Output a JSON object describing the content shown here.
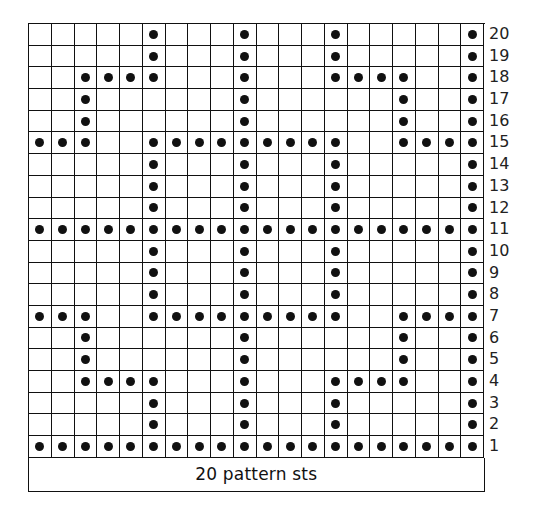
{
  "chart": {
    "title": "",
    "footer_label": "20 pattern sts",
    "columns": 20,
    "rows": 20,
    "symbol_legend": {
      "dot": "purl (filled dot)",
      "empty": "knit (empty square)"
    },
    "colors": {
      "grid_line": "#111111",
      "dot": "#111111",
      "background": "#ffffff"
    },
    "row_labels": [
      "20",
      "19",
      "18",
      "17",
      "16",
      "15",
      "14",
      "13",
      "12",
      "11",
      "10",
      "9",
      "8",
      "7",
      "6",
      "5",
      "4",
      "3",
      "2",
      "1"
    ]
  },
  "chart_data": {
    "type": "heatmap",
    "xlabel": "20 pattern sts",
    "ylabel": "Rows",
    "grid": true,
    "row_order": "top-to-bottom (row 20 first)",
    "rows": [
      {
        "row": 20,
        "dots": [
          6,
          10,
          14,
          20
        ]
      },
      {
        "row": 19,
        "dots": [
          6,
          10,
          14,
          20
        ]
      },
      {
        "row": 18,
        "dots": [
          3,
          4,
          5,
          6,
          10,
          14,
          15,
          16,
          17,
          20
        ]
      },
      {
        "row": 17,
        "dots": [
          3,
          10,
          17,
          20
        ]
      },
      {
        "row": 16,
        "dots": [
          3,
          10,
          17,
          20
        ]
      },
      {
        "row": 15,
        "dots": [
          1,
          2,
          3,
          6,
          7,
          8,
          9,
          10,
          11,
          12,
          13,
          14,
          17,
          18,
          19,
          20
        ]
      },
      {
        "row": 14,
        "dots": [
          6,
          10,
          14,
          20
        ]
      },
      {
        "row": 13,
        "dots": [
          6,
          10,
          14,
          20
        ]
      },
      {
        "row": 12,
        "dots": [
          6,
          10,
          14,
          20
        ]
      },
      {
        "row": 11,
        "dots": [
          1,
          2,
          3,
          4,
          5,
          6,
          7,
          8,
          9,
          10,
          11,
          12,
          13,
          14,
          15,
          16,
          17,
          18,
          19,
          20
        ]
      },
      {
        "row": 10,
        "dots": [
          6,
          10,
          14,
          20
        ]
      },
      {
        "row": 9,
        "dots": [
          6,
          10,
          14,
          20
        ]
      },
      {
        "row": 8,
        "dots": [
          6,
          10,
          14,
          20
        ]
      },
      {
        "row": 7,
        "dots": [
          1,
          2,
          3,
          6,
          7,
          8,
          9,
          10,
          11,
          12,
          13,
          14,
          17,
          18,
          19,
          20
        ]
      },
      {
        "row": 6,
        "dots": [
          3,
          10,
          17,
          20
        ]
      },
      {
        "row": 5,
        "dots": [
          3,
          10,
          17,
          20
        ]
      },
      {
        "row": 4,
        "dots": [
          3,
          4,
          5,
          6,
          10,
          14,
          15,
          16,
          17,
          20
        ]
      },
      {
        "row": 3,
        "dots": [
          6,
          10,
          14,
          20
        ]
      },
      {
        "row": 2,
        "dots": [
          6,
          10,
          14,
          20
        ]
      },
      {
        "row": 1,
        "dots": [
          1,
          2,
          3,
          4,
          5,
          6,
          7,
          8,
          9,
          10,
          11,
          12,
          13,
          14,
          15,
          16,
          17,
          18,
          19,
          20
        ]
      }
    ]
  }
}
